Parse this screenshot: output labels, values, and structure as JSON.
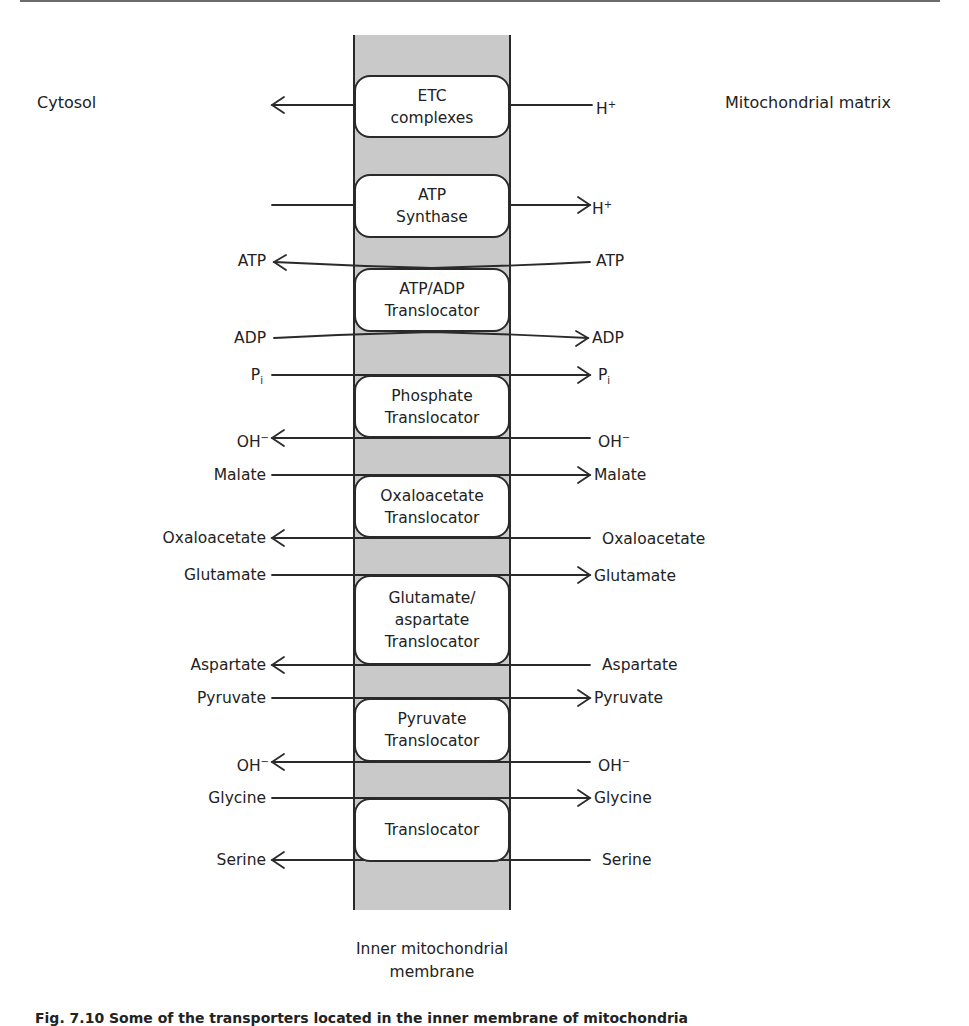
{
  "diagram": {
    "regions": {
      "left": "Cytosol",
      "right": "Mitochondrial matrix",
      "membrane_line1": "Inner mitochondrial",
      "membrane_line2": "membrane"
    },
    "colors": {
      "membrane_fill": "#c9c9c9",
      "line": "#2a2a2a",
      "box_fill": "#ffffff"
    },
    "transporters": [
      {
        "name": "ETC complexes",
        "lines": [
          "ETC",
          "complexes"
        ],
        "flows": [
          {
            "left": "",
            "right": "H",
            "right_sup": "+",
            "direction": "to-cytosol"
          }
        ]
      },
      {
        "name": "ATP Synthase",
        "lines": [
          "ATP",
          "Synthase"
        ],
        "flows": [
          {
            "left": "",
            "right": "H",
            "right_sup": "+",
            "direction": "to-matrix"
          }
        ]
      },
      {
        "name": "ATP/ADP Translocator",
        "lines": [
          "ATP/ADP",
          "Translocator"
        ],
        "flows": [
          {
            "left": "ATP",
            "right": "ATP",
            "direction": "to-cytosol"
          },
          {
            "left": "ADP",
            "right": "ADP",
            "direction": "to-matrix"
          }
        ]
      },
      {
        "name": "Phosphate Translocator",
        "lines": [
          "Phosphate",
          "Translocator"
        ],
        "flows": [
          {
            "left": "P",
            "left_sub": "i",
            "right": "P",
            "right_sub": "i",
            "direction": "to-matrix"
          },
          {
            "left": "OH",
            "left_sup": "−",
            "right": "OH",
            "right_sup": "−",
            "direction": "to-cytosol"
          }
        ]
      },
      {
        "name": "Oxaloacetate Translocator",
        "lines": [
          "Oxaloacetate",
          "Translocator"
        ],
        "flows": [
          {
            "left": "Malate",
            "right": "Malate",
            "direction": "to-matrix"
          },
          {
            "left": "Oxaloacetate",
            "right": "Oxaloacetate",
            "direction": "to-cytosol"
          }
        ]
      },
      {
        "name": "Glutamate/aspartate Translocator",
        "lines": [
          "Glutamate/",
          "aspartate",
          "Translocator"
        ],
        "flows": [
          {
            "left": "Glutamate",
            "right": "Glutamate",
            "direction": "to-matrix"
          },
          {
            "left": "Aspartate",
            "right": "Aspartate",
            "direction": "to-cytosol"
          }
        ]
      },
      {
        "name": "Pyruvate Translocator",
        "lines": [
          "Pyruvate",
          "Translocator"
        ],
        "flows": [
          {
            "left": "Pyruvate",
            "right": "Pyruvate",
            "direction": "to-matrix"
          },
          {
            "left": "OH",
            "left_sup": "−",
            "right": "OH",
            "right_sup": "−",
            "direction": "to-cytosol"
          }
        ]
      },
      {
        "name": "Translocator",
        "lines": [
          "Translocator"
        ],
        "flows": [
          {
            "left": "Glycine",
            "right": "Glycine",
            "direction": "to-matrix"
          },
          {
            "left": "Serine",
            "right": "Serine",
            "direction": "to-cytosol"
          }
        ]
      }
    ],
    "labels": {
      "h_plus_base": "H",
      "plus_sup": "+",
      "minus_sup": "−",
      "atp": "ATP",
      "adp": "ADP",
      "p": "P",
      "i_sub": "i",
      "oh": "OH",
      "malate": "Malate",
      "oxaloacetate": "Oxaloacetate",
      "glutamate": "Glutamate",
      "aspartate": "Aspartate",
      "pyruvate": "Pyruvate",
      "glycine": "Glycine",
      "serine": "Serine"
    },
    "caption_partial": "Fig. 7.10 Some of the transporters located in the inner membrane of mitochondria"
  }
}
